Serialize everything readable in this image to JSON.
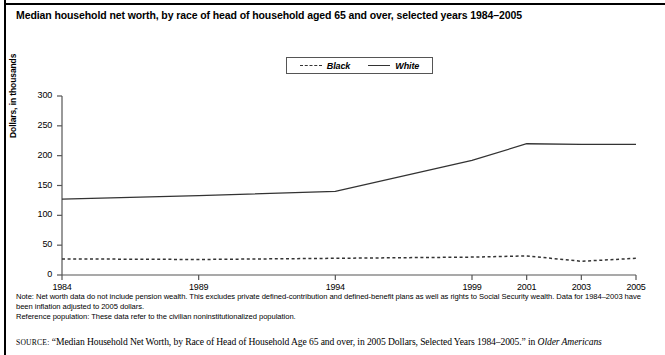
{
  "title": "Median household net worth, by race of head of household aged 65 and over, selected years 1984–2005",
  "legend": {
    "black_label": "Black",
    "white_label": "White"
  },
  "notes": {
    "note_line": "Note: Net worth data do not include pension wealth. This excludes private defined-contribution and defined-benefit plans as well as rights to Social Security wealth. Data for 1984–2003 have been inflation adjusted to 2005 dollars.",
    "reference_line": "Reference population: These data refer to the civilian noninstitutionalized population."
  },
  "source": {
    "label": "SOURCE:",
    "text_before_italic": "“Median Household Net Worth, by Race of Head of Household Age 65 and over, in 2005 Dollars, Selected Years 1984–2005.” in ",
    "italic_text": "Older Americans"
  },
  "chart_data": {
    "type": "line",
    "title": "Median household net worth, by race of head of household aged 65 and over, selected years 1984–2005",
    "xlabel": "",
    "ylabel": "Dollars, in thousands",
    "x": [
      1984,
      1989,
      1994,
      1999,
      2001,
      2003,
      2005
    ],
    "categories": [
      "1984",
      "1989",
      "1994",
      "1999",
      "2001",
      "2003",
      "2005"
    ],
    "xlim": [
      1984,
      2005
    ],
    "ylim": [
      0,
      300
    ],
    "yticks": [
      0,
      50,
      100,
      150,
      200,
      250,
      300
    ],
    "ytick_labels": [
      "0",
      "50",
      "100",
      "150",
      "200",
      "250",
      "300"
    ],
    "grid": false,
    "legend_position": "top-center",
    "series": [
      {
        "name": "Black",
        "style": "dashed",
        "color": "#333333",
        "values": [
          27,
          26,
          28,
          30,
          32,
          23,
          28
        ]
      },
      {
        "name": "White",
        "style": "solid",
        "color": "#333333",
        "values": [
          127,
          133,
          140,
          192,
          220,
          219,
          219
        ]
      }
    ]
  }
}
